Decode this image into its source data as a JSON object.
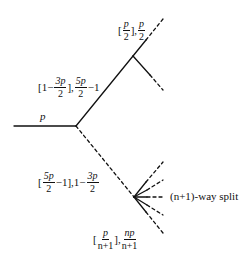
{
  "diagram": {
    "type": "branching-tree",
    "stroke_color": "#111111",
    "root_edge": {
      "label": "p",
      "style": "solid"
    },
    "upper_branch": {
      "label": {
        "bracket_open": "[",
        "pre": "1−",
        "f1_num": "3p",
        "f1_den": "2",
        "mid": "],",
        "f2_num": "5p",
        "f2_den": "2",
        "post": "−1"
      },
      "style": "solid"
    },
    "upper_node_children": {
      "label": {
        "bracket_open": "[",
        "f1_num": "p",
        "f1_den": "2",
        "mid": "],",
        "f2_num": "p",
        "f2_den": "2"
      },
      "count": 2,
      "style": "solid-then-dashed"
    },
    "lower_branch": {
      "label": {
        "bracket_open": "[",
        "f1_num": "5p",
        "f1_den": "2",
        "mid": "−1],1−",
        "f2_num": "3p",
        "f2_den": "2"
      },
      "style": "dashed"
    },
    "lower_node_children": {
      "label": {
        "bracket_open": "[",
        "f1_num": "p",
        "f1_den": "n+1",
        "mid": "],",
        "f2_num": "np",
        "f2_den": "n+1"
      },
      "count": 5,
      "style": "solid-then-dashed",
      "annotation": "(n+1)-way split"
    }
  }
}
